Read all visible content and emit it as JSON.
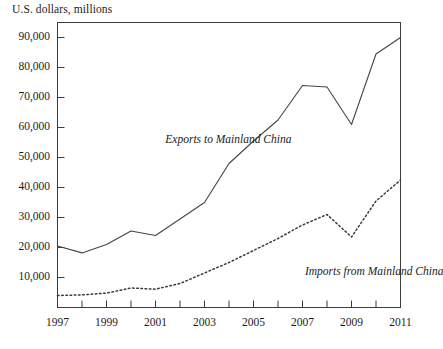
{
  "chart_data": {
    "type": "line",
    "title": "U.S. dollars, millions",
    "xlabel": "",
    "ylabel": "U.S. dollars, millions",
    "x": [
      1997,
      1998,
      1999,
      2000,
      2001,
      2002,
      2003,
      2004,
      2005,
      2006,
      2007,
      2008,
      2009,
      2010,
      2011
    ],
    "xlim": [
      1997,
      2011
    ],
    "ylim": [
      0,
      95000
    ],
    "grid": false,
    "legend_position": "inline-annotation",
    "y_ticks": [
      10000,
      20000,
      30000,
      40000,
      50000,
      60000,
      70000,
      80000,
      90000
    ],
    "y_tick_labels": [
      "10,000",
      "20,000",
      "30,000",
      "40,000",
      "50,000",
      "60,000",
      "70,000",
      "80,000",
      "90,000"
    ],
    "x_ticks": [
      1997,
      1998,
      1999,
      2000,
      2001,
      2002,
      2003,
      2004,
      2005,
      2006,
      2007,
      2008,
      2009,
      2010,
      2011
    ],
    "x_tick_labels": [
      "1997",
      "",
      "1999",
      "",
      "2001",
      "",
      "2003",
      "",
      "2005",
      "",
      "2007",
      "",
      "2009",
      "",
      "2011"
    ],
    "x_major_labels": [
      "1997",
      "1999",
      "2001",
      "2003",
      "2005",
      "2007",
      "2009",
      "2011"
    ],
    "series": [
      {
        "name": "Exports to Mainland China",
        "style": "solid",
        "color": "#444444",
        "values": [
          20500,
          18200,
          21000,
          25500,
          24000,
          29500,
          35000,
          48000,
          55500,
          62500,
          74000,
          73500,
          61000,
          84500,
          90000
        ],
        "annotation": "Exports to Mainland China"
      },
      {
        "name": "Imports from Mainland China",
        "style": "dotted",
        "color": "#3a3a3a",
        "values": [
          4000,
          4200,
          4800,
          6500,
          6100,
          8000,
          11500,
          15000,
          19000,
          23000,
          27500,
          31000,
          23500,
          35500,
          42500
        ],
        "annotation": "Imports from Mainland China"
      }
    ],
    "annotations": [
      {
        "text": "Exports to Mainland China",
        "x": 2001.4,
        "y": 55500
      },
      {
        "text": "Imports from Mainland China",
        "x": 2007.1,
        "y": 11500
      }
    ]
  },
  "axis": {
    "frame_color": "#3c3c3c"
  }
}
